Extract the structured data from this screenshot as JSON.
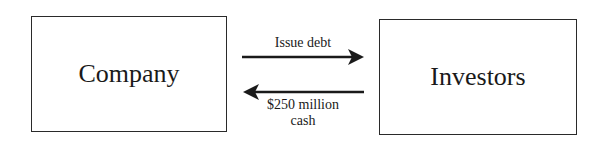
{
  "diagram": {
    "nodes": [
      {
        "id": "company",
        "label": "Company"
      },
      {
        "id": "investors",
        "label": "Investors"
      }
    ],
    "edges": [
      {
        "from": "company",
        "to": "investors",
        "label": "Issue debt"
      },
      {
        "from": "investors",
        "to": "company",
        "label_line1": "$250 million",
        "label_line2": "cash"
      }
    ],
    "colors": {
      "stroke": "#1a1a1a",
      "background": "#ffffff"
    }
  }
}
